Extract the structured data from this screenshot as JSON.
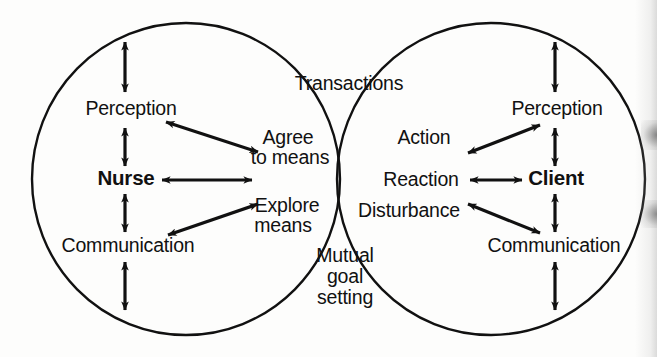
{
  "diagram": {
    "type": "venn-two-circle",
    "colors": {
      "stroke": "#111111",
      "background": "#fdfdfc",
      "text": "#111111"
    },
    "left_circle": {
      "name": "nurse-circle",
      "actor_label": "Nurse",
      "labels": [
        {
          "id": "perception",
          "text": "Perception"
        },
        {
          "id": "nurse",
          "text": "Nurse"
        },
        {
          "id": "communication",
          "text": "Communication"
        }
      ]
    },
    "right_circle": {
      "name": "client-circle",
      "actor_label": "Client",
      "labels": [
        {
          "id": "perception",
          "text": "Perception"
        },
        {
          "id": "client",
          "text": "Client"
        },
        {
          "id": "communication",
          "text": "Communication"
        }
      ]
    },
    "overlap": {
      "name": "transaction-overlap",
      "labels": [
        {
          "id": "transactions",
          "text": "Transactions"
        },
        {
          "id": "agree-line-1",
          "text": "Agree"
        },
        {
          "id": "agree-line-2",
          "text": "to means"
        },
        {
          "id": "action",
          "text": "Action"
        },
        {
          "id": "reaction",
          "text": "Reaction"
        },
        {
          "id": "explore-line-1",
          "text": "Explore"
        },
        {
          "id": "explore-line-2",
          "text": "means"
        },
        {
          "id": "disturbance",
          "text": "Disturbance"
        },
        {
          "id": "mutual-line-1",
          "text": "Mutual"
        },
        {
          "id": "mutual-line-2",
          "text": "goal"
        },
        {
          "id": "mutual-line-3",
          "text": "setting"
        }
      ]
    },
    "arrows": {
      "count": 10,
      "items": [
        {
          "id": "nurse-perception-vertical-top",
          "style": "double-headed",
          "orientation": "vertical"
        },
        {
          "id": "nurse-perception-to-nurse",
          "style": "double-headed",
          "orientation": "vertical"
        },
        {
          "id": "nurse-to-communication",
          "style": "double-headed",
          "orientation": "vertical"
        },
        {
          "id": "nurse-communication-vertical-bottom",
          "style": "double-headed",
          "orientation": "vertical"
        },
        {
          "id": "nurse-perception-to-agree-to-means",
          "style": "double-headed",
          "orientation": "diagonal"
        },
        {
          "id": "nurse-to-overlap",
          "style": "double-headed",
          "orientation": "horizontal"
        },
        {
          "id": "nurse-communication-to-explore-means",
          "style": "double-headed",
          "orientation": "diagonal"
        },
        {
          "id": "client-perception-vertical-top",
          "style": "double-headed",
          "orientation": "vertical"
        },
        {
          "id": "client-perception-to-client",
          "style": "double-headed",
          "orientation": "vertical"
        },
        {
          "id": "client-to-communication",
          "style": "double-headed",
          "orientation": "vertical"
        },
        {
          "id": "client-communication-vertical-bottom",
          "style": "double-headed",
          "orientation": "vertical"
        },
        {
          "id": "client-perception-to-action",
          "style": "double-headed",
          "orientation": "diagonal"
        },
        {
          "id": "client-to-reaction",
          "style": "double-headed",
          "orientation": "horizontal"
        },
        {
          "id": "client-communication-to-disturbance",
          "style": "double-headed",
          "orientation": "diagonal"
        }
      ]
    }
  }
}
